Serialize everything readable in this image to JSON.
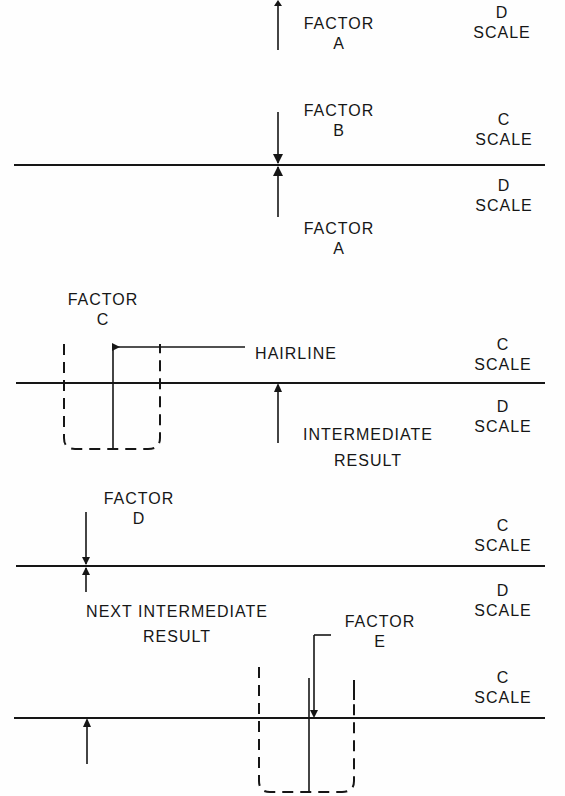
{
  "diagram": {
    "type": "slide-rule-procedure",
    "colors": {
      "ink": "#161616",
      "background": "#fefefe"
    },
    "step1": {
      "scale_right": [
        "D",
        "SCALE"
      ],
      "factor_label": [
        "FACTOR",
        "A"
      ]
    },
    "step2": {
      "factor_top": [
        "FACTOR",
        "B"
      ],
      "scale_top": [
        "C",
        "SCALE"
      ],
      "scale_bottom": [
        "D",
        "SCALE"
      ],
      "factor_bottom": [
        "FACTOR",
        "A"
      ]
    },
    "step3": {
      "factor_label": [
        "FACTOR",
        "C"
      ],
      "hairline_label": "HAIRLINE",
      "scale_top": [
        "C",
        "SCALE"
      ],
      "scale_bottom": [
        "D",
        "SCALE"
      ],
      "result_label": [
        "INTERMEDIATE",
        "RESULT"
      ]
    },
    "step4": {
      "factor_label": [
        "FACTOR",
        "D"
      ],
      "scale_top": [
        "C",
        "SCALE"
      ],
      "scale_bottom": [
        "D",
        "SCALE"
      ],
      "result_label": [
        "NEXT INTERMEDIATE",
        "RESULT"
      ]
    },
    "step5": {
      "factor_label": [
        "FACTOR",
        "E"
      ],
      "scale_top": [
        "C",
        "SCALE"
      ]
    }
  }
}
